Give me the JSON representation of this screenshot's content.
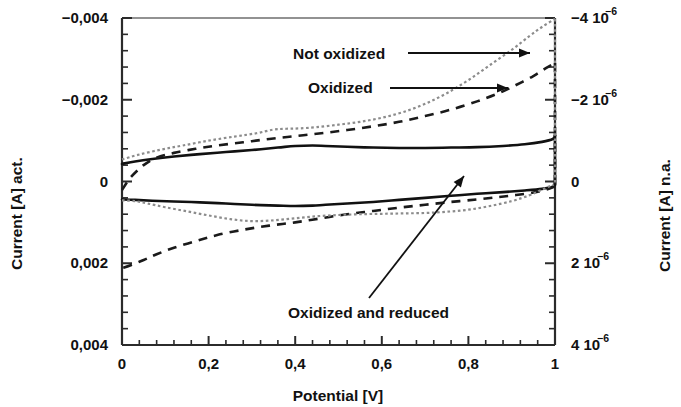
{
  "chart_data": {
    "type": "line",
    "title": "",
    "xlabel": "Potential [V]",
    "ylabel_left": "Current [A] act.",
    "ylabel_right": "Current [A] n.a.",
    "xlim": [
      0,
      1
    ],
    "ylim_left": [
      -0.004,
      0.004
    ],
    "ylim_right": [
      -4e-06,
      4e-06
    ],
    "y_axis_inverted": true,
    "grid": false,
    "legend_position": "inline-annotations",
    "x_ticks": [
      "0",
      "0,2",
      "0,4",
      "0,6",
      "0,8",
      "1"
    ],
    "x_tick_values": [
      0,
      0.2,
      0.4,
      0.6,
      0.8,
      1
    ],
    "x_minor_per_interval": 4,
    "y_ticks_left": [
      "-0,004",
      "-0,002",
      "0",
      "0,002",
      "0,004"
    ],
    "y_tick_values_left": [
      -0.004,
      -0.002,
      0,
      0.002,
      0.004
    ],
    "y_ticks_right": [
      {
        "mantissa": "-4",
        "base": "10",
        "exp": "-6"
      },
      {
        "mantissa": "-2",
        "base": "10",
        "exp": "-6"
      },
      {
        "mantissa": "0",
        "base": "",
        "exp": ""
      },
      {
        "mantissa": "2",
        "base": "10",
        "exp": "-6"
      },
      {
        "mantissa": "4",
        "base": "10",
        "exp": "-6"
      }
    ],
    "y_tick_values_right": [
      -4e-06,
      -2e-06,
      0,
      2e-06,
      4e-06
    ],
    "y_minor_per_interval": 4,
    "series": [
      {
        "name": "Oxidized and reduced",
        "style": "solid",
        "color": "#111111",
        "branch": "forward",
        "x": [
          0.0,
          0.03,
          0.07,
          0.12,
          0.18,
          0.24,
          0.3,
          0.36,
          0.4,
          0.44,
          0.47,
          0.52,
          0.58,
          0.64,
          0.7,
          0.76,
          0.82,
          0.88,
          0.93,
          0.97,
          0.995,
          1.0
        ],
        "y": [
          -0.00043,
          -0.00049,
          -0.00055,
          -0.00061,
          -0.00067,
          -0.00072,
          -0.00077,
          -0.00083,
          -0.00087,
          -0.00088,
          -0.00087,
          -0.00085,
          -0.00083,
          -0.00082,
          -0.00082,
          -0.00083,
          -0.00084,
          -0.00087,
          -0.00091,
          -0.00097,
          -0.00104,
          -0.00112
        ]
      },
      {
        "name": "Oxidized and reduced",
        "style": "solid",
        "color": "#111111",
        "branch": "reverse",
        "x": [
          1.0,
          0.995,
          0.97,
          0.93,
          0.88,
          0.82,
          0.76,
          0.7,
          0.64,
          0.58,
          0.52,
          0.47,
          0.44,
          0.4,
          0.36,
          0.3,
          0.24,
          0.18,
          0.12,
          0.07,
          0.03,
          0.0
        ],
        "y": [
          8e-05,
          0.00013,
          0.00018,
          0.00022,
          0.00026,
          0.0003,
          0.00035,
          0.0004,
          0.00045,
          0.0005,
          0.00054,
          0.00057,
          0.00059,
          0.0006,
          0.00059,
          0.00057,
          0.00054,
          0.00051,
          0.00049,
          0.00047,
          0.00045,
          0.00044
        ]
      },
      {
        "name": "Oxidized",
        "style": "dashed",
        "color": "#1a1a1a",
        "branch": "forward",
        "x": [
          0.0,
          0.02,
          0.05,
          0.08,
          0.12,
          0.17,
          0.22,
          0.28,
          0.34,
          0.4,
          0.46,
          0.52,
          0.58,
          0.64,
          0.7,
          0.76,
          0.82,
          0.87,
          0.91,
          0.95,
          0.98,
          1.0
        ],
        "y": [
          0.00021,
          -0.0001,
          -0.0004,
          -0.00058,
          -0.0007,
          -0.0008,
          -0.00088,
          -0.00096,
          -0.00104,
          -0.00111,
          -0.00118,
          -0.00126,
          -0.00135,
          -0.00146,
          -0.0016,
          -0.00176,
          -0.00196,
          -0.00216,
          -0.00236,
          -0.00258,
          -0.00278,
          -0.0029
        ]
      },
      {
        "name": "Oxidized",
        "style": "dashed",
        "color": "#1a1a1a",
        "branch": "reverse",
        "x": [
          1.0,
          0.98,
          0.95,
          0.91,
          0.87,
          0.82,
          0.76,
          0.7,
          0.64,
          0.58,
          0.52,
          0.46,
          0.4,
          0.34,
          0.28,
          0.22,
          0.17,
          0.12,
          0.08,
          0.05,
          0.02,
          0.0
        ],
        "y": [
          0.00012,
          0.0002,
          0.00027,
          0.00033,
          0.00038,
          0.00044,
          0.0005,
          0.00057,
          0.00064,
          0.00072,
          0.0008,
          0.0009,
          0.001,
          0.00108,
          0.00118,
          0.00131,
          0.00146,
          0.00162,
          0.00178,
          0.00192,
          0.00205,
          0.00212
        ]
      },
      {
        "name": "Not oxidized",
        "style": "dotted",
        "color": "#8c8c8c",
        "branch": "forward",
        "x": [
          0.0,
          0.04,
          0.09,
          0.14,
          0.2,
          0.26,
          0.31,
          0.35,
          0.38,
          0.41,
          0.45,
          0.5,
          0.55,
          0.6,
          0.65,
          0.7,
          0.75,
          0.8,
          0.85,
          0.9,
          0.94,
          0.97,
          1.0
        ],
        "y": [
          -0.00054,
          -0.00066,
          -0.00078,
          -0.00088,
          -0.001,
          -0.0011,
          -0.00118,
          -0.00127,
          -0.00129,
          -0.0013,
          -0.00133,
          -0.00139,
          -0.00146,
          -0.00156,
          -0.0017,
          -0.0019,
          -0.00216,
          -0.00248,
          -0.00285,
          -0.00322,
          -0.00355,
          -0.00378,
          -0.00398
        ]
      },
      {
        "name": "Not oxidized",
        "style": "dotted",
        "color": "#8c8c8c",
        "branch": "reverse",
        "x": [
          1.0,
          0.97,
          0.94,
          0.9,
          0.85,
          0.8,
          0.75,
          0.7,
          0.65,
          0.6,
          0.55,
          0.5,
          0.45,
          0.4,
          0.35,
          0.3,
          0.25,
          0.2,
          0.15,
          0.1,
          0.06,
          0.03,
          0.0
        ],
        "y": [
          6e-05,
          0.0002,
          0.00034,
          0.00048,
          0.0006,
          0.00069,
          0.00074,
          0.00077,
          0.00078,
          0.00079,
          0.0008,
          0.00082,
          0.00085,
          0.0009,
          0.00095,
          0.00097,
          0.00092,
          0.00083,
          0.00073,
          0.00063,
          0.00054,
          0.00048,
          0.00046
        ]
      }
    ],
    "annotations": [
      {
        "id": "not-oxidized",
        "text": "Not oxidized",
        "text_x": 293,
        "text_y": 59,
        "leader_from_x": 408,
        "leader_from_y": 53,
        "leader_to_x": 530,
        "leader_to_y": 53
      },
      {
        "id": "oxidized",
        "text": "Oxidized",
        "text_x": 308,
        "text_y": 93,
        "leader_from_x": 390,
        "leader_from_y": 88,
        "leader_to_x": 508,
        "leader_to_y": 88
      },
      {
        "id": "oxidized-and-reduced",
        "text": "Oxidized and reduced",
        "text_x": 288,
        "text_y": 318,
        "leader_from_x": 369,
        "leader_from_y": 298,
        "leader_to_x": 464,
        "leader_to_y": 176
      }
    ]
  }
}
